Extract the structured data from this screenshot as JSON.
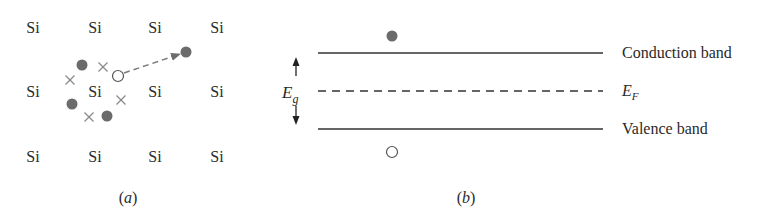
{
  "figure": {
    "panel_a": {
      "caption": "(a)",
      "caption_letter": "a",
      "atoms": [
        {
          "label": "Si",
          "x": 33,
          "y": 28
        },
        {
          "label": "Si",
          "x": 95,
          "y": 28
        },
        {
          "label": "Si",
          "x": 155,
          "y": 28
        },
        {
          "label": "Si",
          "x": 217,
          "y": 28
        },
        {
          "label": "Si",
          "x": 33,
          "y": 92
        },
        {
          "label": "Si",
          "x": 95,
          "y": 92
        },
        {
          "label": "Si",
          "x": 155,
          "y": 92
        },
        {
          "label": "Si",
          "x": 217,
          "y": 92
        },
        {
          "label": "Si",
          "x": 33,
          "y": 157
        },
        {
          "label": "Si",
          "x": 95,
          "y": 157
        },
        {
          "label": "Si",
          "x": 155,
          "y": 157
        },
        {
          "label": "Si",
          "x": 217,
          "y": 157
        }
      ],
      "electrons": [
        {
          "x": 82,
          "y": 65
        },
        {
          "x": 72,
          "y": 104
        },
        {
          "x": 107,
          "y": 116
        },
        {
          "x": 186,
          "y": 52
        }
      ],
      "bond_marks": [
        {
          "x": 103,
          "y": 67
        },
        {
          "x": 70,
          "y": 80
        },
        {
          "x": 121,
          "y": 100
        },
        {
          "x": 89,
          "y": 117
        }
      ],
      "hole": {
        "x": 118,
        "y": 76
      },
      "arrow": {
        "from": [
          124,
          73
        ],
        "to": [
          180,
          54
        ]
      }
    },
    "panel_b": {
      "caption": "(b)",
      "caption_letter": "b",
      "conduction_band_label": "Conduction band",
      "fermi_label_main": "E",
      "fermi_label_sub": "F",
      "valence_band_label": "Valence band",
      "gap_label_main": "E",
      "gap_label_sub": "g",
      "levels": {
        "conduction_y": 53,
        "fermi_y": 91,
        "valence_y": 129,
        "x_start": 318,
        "x_end": 603
      },
      "electron": {
        "x": 392,
        "y": 36
      },
      "hole": {
        "x": 392,
        "y": 152
      }
    },
    "colors": {
      "ink": "#2a2a2a",
      "particle": "#6b6b6b",
      "mark": "#8a8a8a",
      "arrow": "#7a7a7a"
    }
  }
}
